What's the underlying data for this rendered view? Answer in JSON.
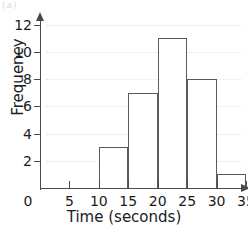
{
  "chart_data": {
    "type": "bar",
    "title": "",
    "xlabel": "Time (seconds)",
    "ylabel": "Frequency",
    "categories": [
      "10-15",
      "15-20",
      "20-25",
      "25-30",
      "30-35"
    ],
    "bin_edges": [
      10,
      15,
      20,
      25,
      30,
      35
    ],
    "values": [
      3,
      7,
      11,
      8,
      1
    ],
    "xlim": [
      0,
      35
    ],
    "ylim": [
      0,
      12
    ],
    "x_ticks": [
      "0",
      "5",
      "10",
      "15",
      "20",
      "25",
      "30",
      "35"
    ],
    "x_tick_values": [
      0,
      5,
      10,
      15,
      20,
      25,
      30,
      35
    ],
    "y_ticks": [
      "2",
      "4",
      "6",
      "8",
      "10",
      "12"
    ],
    "y_tick_values": [
      2,
      4,
      6,
      8,
      10,
      12
    ],
    "grid": true,
    "legend": null,
    "bar_edge_color": "#5a5a5a",
    "bar_fill_color": "#ffffff",
    "axis_color": "#4a4a4a",
    "gridline_color": "#e3e2ec",
    "text_color": "#1b1b1b"
  },
  "annotations": {
    "corner_mark": "(a)"
  }
}
